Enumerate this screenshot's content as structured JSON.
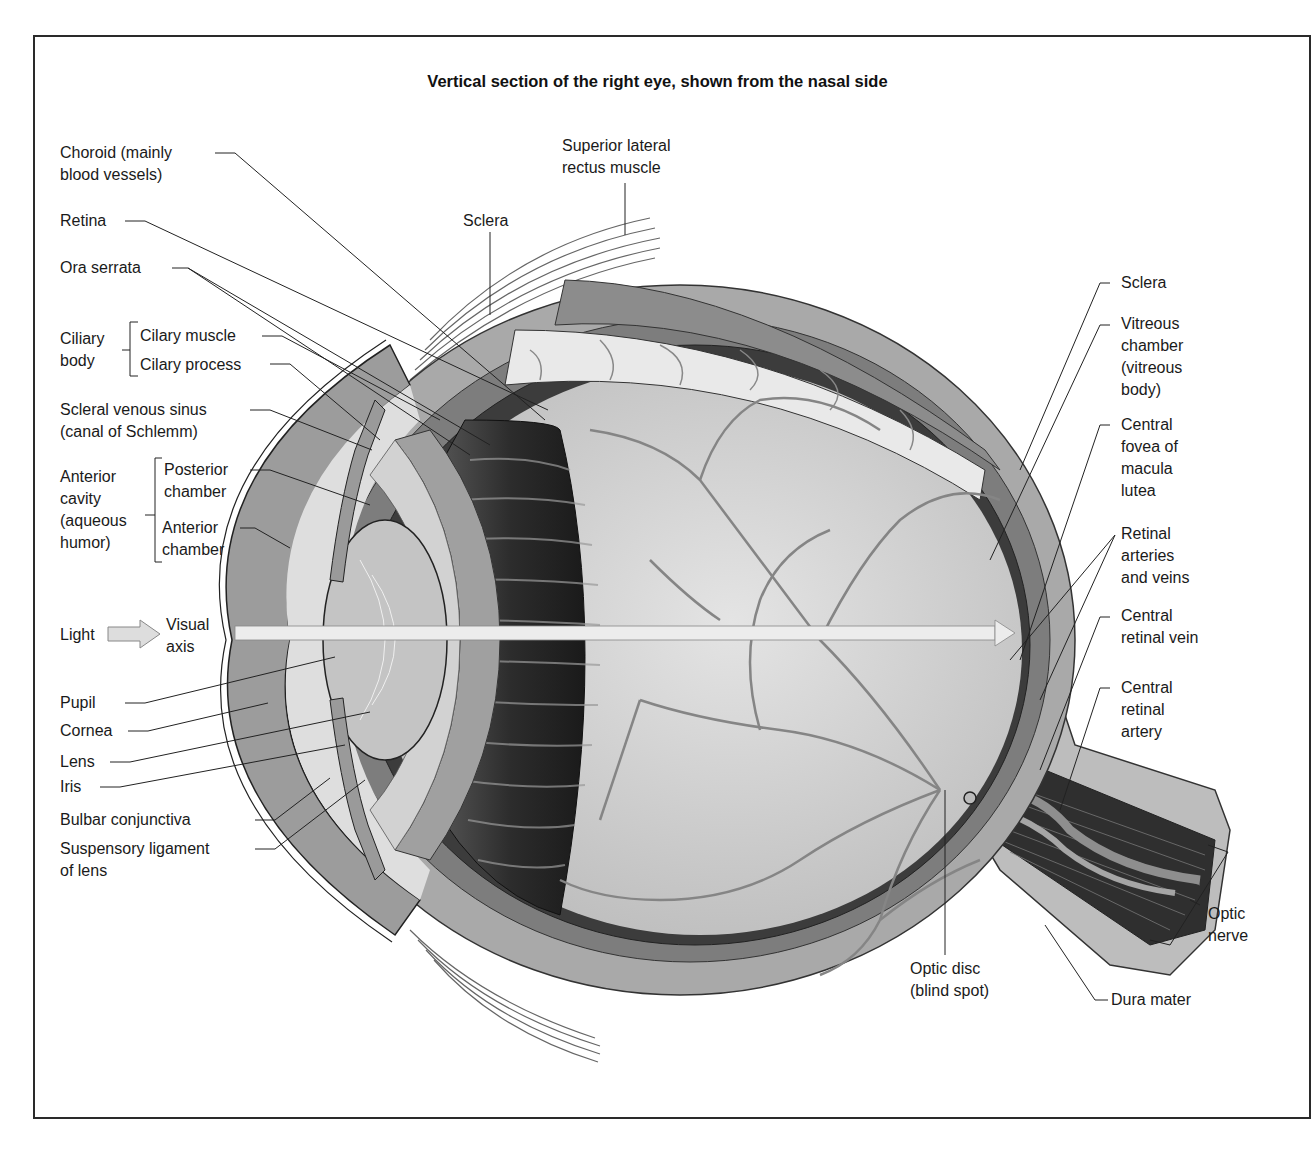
{
  "title": "Vertical section of the right eye, shown from the nasal side",
  "colors": {
    "frame": "#2a2a2a",
    "sclera": "#a9a9a9",
    "choroid": "#7d7d7d",
    "retina_dark": "#3c3c3c",
    "vitreous": "#cfcfcf",
    "cornea": "#9c9c9c",
    "aqueous": "#dedede",
    "lens": "#c4c4c4",
    "vessel": "#8a8a8a",
    "axis": "#ececec",
    "line": "#222222"
  },
  "labels": {
    "left": {
      "choroid": "Choroid (mainly\nblood vessels)",
      "retina": "Retina",
      "ora_serrata": "Ora serrata",
      "ciliary_body": "Ciliary\nbody",
      "ciliary_muscle": "Cilary muscle",
      "ciliary_process": "Cilary process",
      "scleral_venous_sinus": "Scleral venous sinus\n(canal of Schlemm)",
      "anterior_cavity": "Anterior\ncavity\n(aqueous\nhumor)",
      "posterior_chamber": "Posterior\nchamber",
      "anterior_chamber": "Anterior\nchamber",
      "light": "Light",
      "visual_axis": "Visual\naxis",
      "pupil": "Pupil",
      "cornea": "Cornea",
      "lens": "Lens",
      "iris": "Iris",
      "bulbar_conjunctiva": "Bulbar conjunctiva",
      "suspensory_ligament": "Suspensory ligament\nof lens"
    },
    "top": {
      "superior_rectus": "Superior lateral\nrectus muscle",
      "sclera": "Sclera"
    },
    "right": {
      "sclera": "Sclera",
      "vitreous_chamber": "Vitreous\nchamber\n(vitreous\nbody)",
      "central_fovea": "Central\nfovea of\nmacula\nlutea",
      "retinal_arteries_veins": "Retinal\narteries\nand veins",
      "central_retinal_vein": "Central\nretinal vein",
      "central_retinal_artery": "Central\nretinal\nartery",
      "optic_nerve": "Optic\nnerve",
      "dura_mater": "Dura mater"
    },
    "bottom": {
      "optic_disc": "Optic disc\n(blind spot)"
    }
  }
}
